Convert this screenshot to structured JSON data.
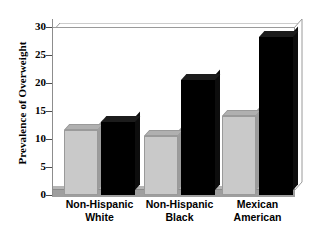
{
  "chart_data": {
    "type": "bar",
    "title": "",
    "subtitle": "",
    "xlabel": "",
    "ylabel": "Prevalence of Overweight",
    "categories": [
      "Non-Hispanic White",
      "Non-Hispanic Black",
      "Mexican American"
    ],
    "category_lines": [
      [
        "Non-Hispanic",
        "White"
      ],
      [
        "Non-Hispanic",
        "Black"
      ],
      [
        "Mexican",
        "American"
      ]
    ],
    "series": [
      {
        "name": "light-gray-series",
        "color": "#c9c9c9",
        "values": [
          11.6,
          10.5,
          14.1
        ]
      },
      {
        "name": "black-series",
        "color": "#000000",
        "values": [
          13.0,
          20.5,
          28.2
        ]
      }
    ],
    "ylim": [
      0,
      30
    ],
    "ytick_values": [
      0,
      5,
      10,
      15,
      20,
      25,
      30
    ],
    "ytick_labels": [
      "0",
      "5",
      "10",
      "15",
      "20",
      "25",
      "30"
    ],
    "grid": false,
    "legend": "none",
    "style": "3d-columns"
  },
  "axes": {
    "y_title": "Prevalence of Overweight"
  }
}
